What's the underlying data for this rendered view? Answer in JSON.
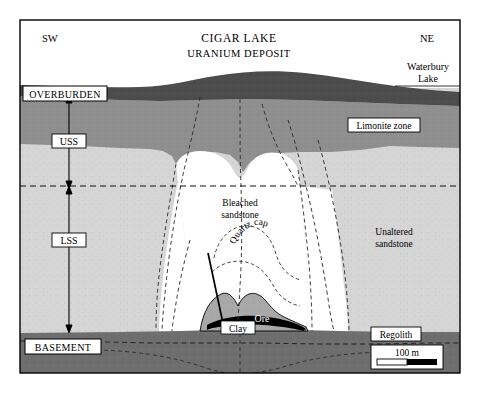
{
  "figure": {
    "title_line1": "CIGAR LAKE",
    "title_line2": "URANIUM DEPOSIT",
    "orientation_left": "SW",
    "orientation_right": "NE",
    "water_body_line1": "Waterbury",
    "water_body_line2": "Lake"
  },
  "units": {
    "overburden": "OVERBURDEN",
    "uss": "USS",
    "lss": "LSS",
    "basement": "BASEMENT",
    "regolith": "Regolith",
    "limonite_zone": "Limonite zone",
    "unaltered_line1": "Unaltered",
    "unaltered_line2": "sandstone",
    "bleached_line1": "Bleached",
    "bleached_line2": "sandstone",
    "quartz_cap": "Quartz cap",
    "ore": "Ore",
    "clay": "Clay"
  },
  "scale_bar": {
    "label": "100 m"
  },
  "colors": {
    "frame": "#000000",
    "sky": "#ffffff",
    "overburden": "#4c4c4c",
    "limonite": "#8f8f8f",
    "sandstone": "#d5d5d5",
    "bleached": "#ffffff",
    "basement": "#6e6e6e",
    "clay": "#a8a8a8",
    "ore": "#000000",
    "quartz_cap_fill": "#ffffff",
    "label_box_fill": "#ffffff",
    "dashed_line": "#1a1a1a"
  }
}
